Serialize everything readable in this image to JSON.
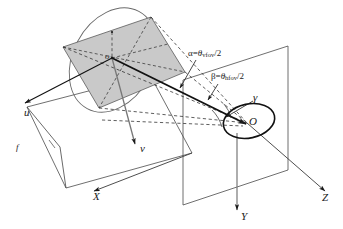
{
  "figure": {
    "background_color": "#ffffff",
    "line_color": "#1a1a1a",
    "image_plane_fill": "#c9c9c9",
    "image_plane_stroke": "#555555",
    "width": 343,
    "height": 229
  },
  "labels": {
    "u_axis": "u",
    "v_axis": "v",
    "x_axis": "X",
    "y_axis": "Y",
    "z_axis": "Z",
    "gamma": "γ",
    "focal_length": "f",
    "image_origin": "o",
    "camera_origin": "O",
    "alpha_equation_lead": "α=",
    "alpha_theta": "θ",
    "alpha_sub": "vfov",
    "alpha_tail": "/2",
    "beta_equation_lead": "β=",
    "beta_theta": "θ",
    "beta_sub": "hfov",
    "beta_tail": "/2"
  },
  "geometry": {
    "image_plane_quad": "63,47 151,17 185,72 99,108",
    "lens_ellipse": {
      "cx": 113,
      "cy": 60,
      "rx": 55,
      "ry": 40,
      "rotation": -62
    },
    "aperture_ellipse": {
      "cx": 249,
      "cy": 121,
      "rx": 26,
      "ry": 17,
      "rotation": -12
    },
    "world_plane_quad": "183,80 288,46 288,170 183,205",
    "ground_plane_quad": "27,107 150,75 192,153 66,188",
    "optical_axis": "112,58 246,124",
    "image_center": {
      "x": 112,
      "y": 58
    },
    "camera_center": {
      "x": 247,
      "y": 123
    }
  },
  "axes": {
    "u": {
      "from": "112,58",
      "to": "23,104"
    },
    "v": {
      "from": "112,58",
      "to": "136,146"
    },
    "x": {
      "from": "192,153",
      "to": "92,192"
    },
    "y": {
      "from": "237,133",
      "to": "237,212"
    },
    "z": {
      "from": "247,123",
      "to": "327,193"
    }
  }
}
